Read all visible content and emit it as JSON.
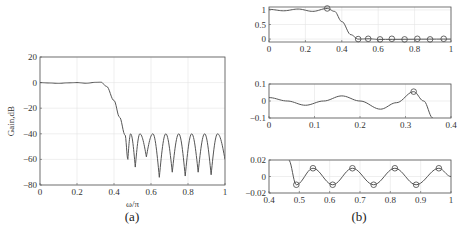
{
  "chart_data": [
    {
      "id": "a",
      "type": "line",
      "caption": "(a)",
      "title": "",
      "xlabel": "ω/π",
      "ylabel": "Gain,dB",
      "xlim": [
        0,
        1
      ],
      "ylim": [
        -80,
        20
      ],
      "xticks": [
        "0",
        "0.2",
        "0.4",
        "0.6",
        "0.8",
        "1"
      ],
      "yticks": [
        "20",
        "0",
        "-20",
        "-40",
        "-60",
        "-80"
      ],
      "grid": true,
      "series": [
        {
          "name": "magnitude response",
          "x": [
            0,
            0.05,
            0.1,
            0.15,
            0.2,
            0.25,
            0.3,
            0.33,
            0.36,
            0.4,
            0.43,
            0.46,
            0.475,
            0.49,
            0.515,
            0.54,
            0.575,
            0.61,
            0.645,
            0.68,
            0.715,
            0.75,
            0.785,
            0.82,
            0.855,
            0.89,
            0.925,
            0.96,
            1.0
          ],
          "values": [
            0,
            -0.3,
            -0.6,
            -0.2,
            0,
            -0.5,
            0.2,
            0.3,
            -3,
            -14,
            -27,
            -41,
            -60,
            -40,
            -66,
            -40,
            -58,
            -40,
            -74,
            -40,
            -70,
            -40,
            -73,
            -40,
            -70,
            -40,
            -72,
            -40,
            -60
          ]
        }
      ],
      "stopband_ripple_peak_db": -40
    },
    {
      "id": "b1",
      "type": "line",
      "caption": "(b)",
      "xlim": [
        0,
        1
      ],
      "ylim": [
        -0.1,
        1.1
      ],
      "xticks": [
        "0",
        "0.2",
        "0.4",
        "0.6",
        "0.8",
        "1"
      ],
      "yticks": [
        "1",
        "0.5",
        "0"
      ],
      "grid": true,
      "series": [
        {
          "name": "amplitude response",
          "x": [
            0,
            0.08,
            0.16,
            0.24,
            0.32,
            0.36,
            0.4,
            0.45,
            0.49,
            0.55,
            0.6,
            1.0
          ],
          "values": [
            1.02,
            0.97,
            1.03,
            0.95,
            1.05,
            0.95,
            0.6,
            0.15,
            0,
            0.01,
            -0.01,
            0
          ]
        },
        {
          "name": "extremal points",
          "type": "scatter",
          "x": [
            0.32,
            0.49,
            0.545,
            0.61,
            0.675,
            0.745,
            0.815,
            0.885,
            0.96
          ],
          "values": [
            1.05,
            0,
            0.01,
            -0.01,
            0.01,
            -0.01,
            0.01,
            -0.01,
            0.01
          ]
        }
      ]
    },
    {
      "id": "b2",
      "type": "line",
      "title": "passband detail",
      "xlim": [
        0,
        0.4
      ],
      "ylim": [
        -0.1,
        0.1
      ],
      "xticks": [
        "0",
        "0.1",
        "0.2",
        "0.3",
        "0.4"
      ],
      "yticks": [
        "0.1",
        "0",
        "-0.1"
      ],
      "grid": true,
      "series": [
        {
          "name": "passband error",
          "x": [
            0,
            0.04,
            0.08,
            0.12,
            0.16,
            0.2,
            0.245,
            0.28,
            0.318,
            0.34,
            0.36
          ],
          "values": [
            0.02,
            0.0,
            -0.025,
            0.0,
            0.03,
            0.0,
            -0.048,
            -0.01,
            0.055,
            0.0,
            -0.1
          ]
        },
        {
          "name": "extremal point",
          "type": "scatter",
          "x": [
            0.318
          ],
          "values": [
            0.055
          ]
        }
      ]
    },
    {
      "id": "b3",
      "type": "line",
      "title": "stopband detail",
      "xlim": [
        0.4,
        1
      ],
      "ylim": [
        -0.02,
        0.02
      ],
      "xticks": [
        "0.4",
        "0.5",
        "0.6",
        "0.7",
        "0.8",
        "0.9",
        "1"
      ],
      "yticks": [
        "0.02",
        "0",
        "-0.02"
      ],
      "grid": true,
      "series": [
        {
          "name": "stopband response",
          "x": [
            0.465,
            0.49,
            0.545,
            0.61,
            0.675,
            0.745,
            0.815,
            0.885,
            0.96,
            1.0
          ],
          "values": [
            0.02,
            -0.01,
            0.01,
            -0.01,
            0.01,
            -0.01,
            0.01,
            -0.01,
            0.01,
            0.0
          ]
        },
        {
          "name": "extremal points",
          "type": "scatter",
          "x": [
            0.49,
            0.545,
            0.61,
            0.675,
            0.745,
            0.815,
            0.885,
            0.96
          ],
          "values": [
            -0.01,
            0.01,
            -0.01,
            0.01,
            -0.01,
            0.01,
            -0.01,
            0.01
          ]
        }
      ]
    }
  ],
  "captions": {
    "a": "(a)",
    "b": "(b)"
  },
  "labels": {
    "a_xlabel": "ω/π",
    "a_ylabel": "Gain,dB"
  }
}
